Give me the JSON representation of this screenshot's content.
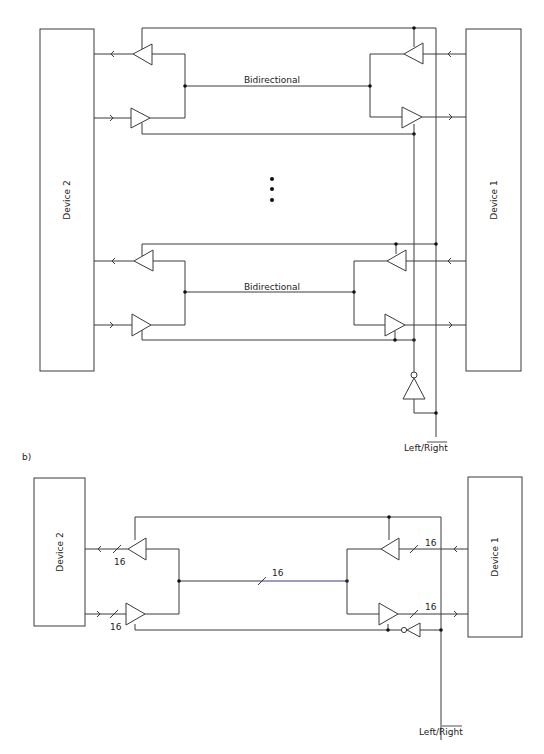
{
  "diagram_a": {
    "device_left_label": "Device 2",
    "device_right_label": "Device 1",
    "bus_labels": [
      "Bidirectional",
      "Bidirectional"
    ],
    "ellipsis": "• • •",
    "control_label_left": "Left/",
    "control_label_right_overlined": "Right"
  },
  "diagram_b": {
    "part_label": "b)",
    "device_left_label": "Device 2",
    "device_right_label": "Device 1",
    "bus_width_labels": {
      "left_upper": "16",
      "left_lower": "16",
      "bus": "16",
      "right_upper": "16",
      "right_lower": "16"
    },
    "control_label_left": "Left/",
    "control_label_right_overlined": "Right"
  },
  "colors": {
    "wire": "#3a3a3a",
    "bus_b": "#3a3a8a",
    "node": "#111111"
  }
}
